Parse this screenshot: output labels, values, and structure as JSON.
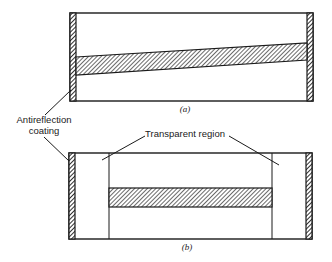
{
  "figure": {
    "panel_a": {
      "caption": "(a)"
    },
    "panel_b": {
      "caption": "(b)"
    },
    "labels": {
      "antireflection_line1": "Antireflection",
      "antireflection_line2": "coating",
      "transparent_region": "Transparent region"
    },
    "colors": {
      "ink": "#1a1a1a",
      "background": "#ffffff"
    }
  }
}
